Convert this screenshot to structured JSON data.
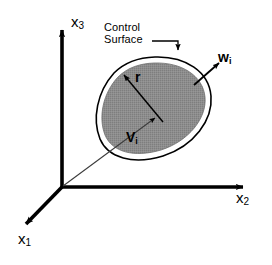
{
  "figure": {
    "background_color": "#ffffff",
    "line_color": "#000000",
    "region_fill_color": "#8a8a8a",
    "region_gap_color": "#ffffff",
    "thin_line_color": "#555555"
  },
  "axes": {
    "x1": {
      "label": "x",
      "subscript": "1",
      "direction": "down-left",
      "arrow": true
    },
    "x2": {
      "label": "x",
      "subscript": "2",
      "direction": "right",
      "arrow": true
    },
    "x3": {
      "label": "x",
      "subscript": "3",
      "direction": "up",
      "arrow": true
    }
  },
  "annotations": {
    "control_surface": {
      "line1": "Control",
      "line2": "Surface",
      "leader": "elbow-down-arrow"
    },
    "normal_vector": {
      "label": "w",
      "subscript": "i",
      "bold": true,
      "description": "outward normal vector at control surface"
    },
    "volume_vector": {
      "label": "V",
      "subscript": "i",
      "bold": true,
      "description": "position vector from origin to control volume"
    },
    "radius": {
      "label": "r",
      "bold": true,
      "description": "radius vector from interior point to control surface"
    }
  },
  "icons": {
    "arrowhead": "arrowhead-icon"
  }
}
